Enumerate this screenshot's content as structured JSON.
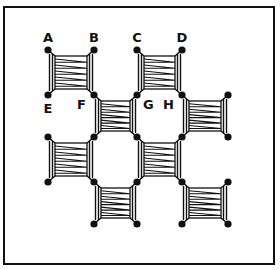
{
  "diagram": {
    "title": "",
    "frame": {
      "x": 4,
      "y": 7,
      "width": 270,
      "height": 257
    },
    "grid": {
      "cols": [
        48,
        94,
        137,
        182,
        228
      ],
      "rows": [
        50,
        95,
        137,
        182,
        224
      ]
    },
    "labels": [
      {
        "text": "A",
        "col": 0,
        "row": 0,
        "pos": "above"
      },
      {
        "text": "B",
        "col": 1,
        "row": 0,
        "pos": "above"
      },
      {
        "text": "C",
        "col": 2,
        "row": 0,
        "pos": "above"
      },
      {
        "text": "D",
        "col": 3,
        "row": 0,
        "pos": "above"
      },
      {
        "text": "E",
        "col": 0,
        "row": 1,
        "pos": "below"
      },
      {
        "text": "F",
        "col": 1,
        "row": 1,
        "pos": "left"
      },
      {
        "text": "G",
        "col": 2,
        "row": 1,
        "pos": "right"
      },
      {
        "text": "H",
        "col": 3,
        "row": 1,
        "pos": "left"
      }
    ],
    "units": [
      {
        "c": 0,
        "r": 0
      },
      {
        "c": 2,
        "r": 0
      },
      {
        "c": 1,
        "r": 1
      },
      {
        "c": 3,
        "r": 1
      },
      {
        "c": 0,
        "r": 2
      },
      {
        "c": 2,
        "r": 2
      },
      {
        "c": 1,
        "r": 3
      },
      {
        "c": 3,
        "r": 3
      }
    ],
    "colors": {
      "ink": "#111111",
      "background": "#ffffff"
    }
  }
}
